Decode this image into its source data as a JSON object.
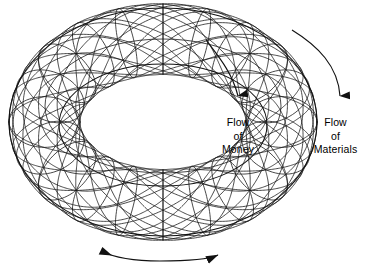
{
  "figure": {
    "type": "wireframe-torus-diagram",
    "stroke_color": "#1a1a1a",
    "background_color": "#ffffff"
  },
  "annotations": {
    "flow_money": {
      "lines": [
        "Flow",
        "of",
        "Money"
      ],
      "arrow_direction": "down",
      "arrow_tip": {
        "x": 238,
        "y": 110
      }
    },
    "flow_materials": {
      "lines": [
        "Flow",
        "of",
        "Materials"
      ],
      "arrow_direction": "down",
      "arrow_tip": {
        "x": 340,
        "y": 110
      }
    },
    "rotation_arrow": {
      "direction": "bidirectional",
      "left_tip": {
        "x": 95,
        "y": 251
      },
      "right_tip": {
        "x": 224,
        "y": 256
      }
    }
  },
  "geometry": {
    "center": {
      "x": 163,
      "y": 122
    },
    "outer_ellipse": {
      "rx": 154,
      "ry": 114
    },
    "inner_ellipse": {
      "rx": 104,
      "ry": 61
    },
    "meridian_count": 20,
    "helix_turns": 2
  }
}
